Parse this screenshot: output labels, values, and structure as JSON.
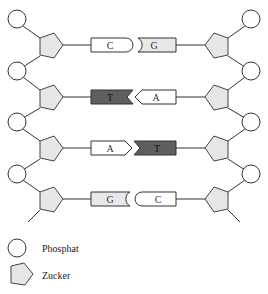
{
  "diagram": {
    "type": "dna-double-strand-schematic",
    "rows": [
      {
        "left_base": "C",
        "right_base": "G",
        "left_fill": "#ffffff",
        "right_fill": "#e8e8e8",
        "pairing": "C-G"
      },
      {
        "left_base": "T",
        "right_base": "A",
        "left_fill": "#5f5f5f",
        "right_fill": "#ffffff",
        "pairing": "T-A"
      },
      {
        "left_base": "A",
        "right_base": "T",
        "left_fill": "#ffffff",
        "right_fill": "#5f5f5f",
        "pairing": "A-T"
      },
      {
        "left_base": "G",
        "right_base": "C",
        "left_fill": "#e8e8e8",
        "right_fill": "#ffffff",
        "pairing": "G-C"
      }
    ],
    "legend": {
      "phosphate_label": "Phosphat",
      "sugar_label": "Zucker"
    },
    "colors": {
      "sugar_fill": "#e6e6e6",
      "dark_base": "#5f5f5f",
      "light_base": "#e8e8e8",
      "outline": "#333333"
    }
  }
}
